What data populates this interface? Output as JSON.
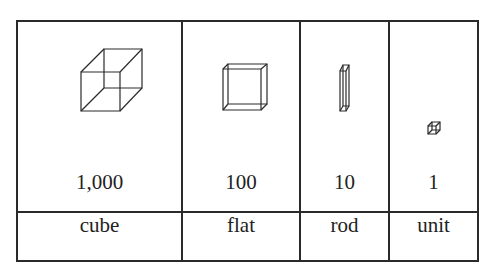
{
  "columns": [
    {
      "block": "cube",
      "value": "1,000",
      "icon": "cube-icon"
    },
    {
      "block": "flat",
      "value": "100",
      "icon": "flat-icon"
    },
    {
      "block": "rod",
      "value": "10",
      "icon": "rod-icon"
    },
    {
      "block": "unit",
      "value": "1",
      "icon": "unit-icon"
    }
  ],
  "colors": {
    "line": "#2a2a2a",
    "text": "#222222",
    "background": "#ffffff"
  }
}
